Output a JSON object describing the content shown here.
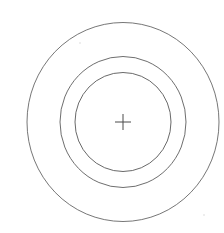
{
  "figure": {
    "kind": "concentric-circles-target",
    "background_color": "#ffffff",
    "stroke_color": "#5a5a5a",
    "canvas": {
      "width": 224,
      "height": 233
    },
    "center": {
      "x": 123,
      "y": 122
    },
    "center_mark": {
      "name": "crosshair",
      "glyph": "+",
      "half_length_x": 8,
      "half_length_y": 8,
      "stroke_color": "#4a4a4a",
      "stroke_width": 1.0
    },
    "rings": [
      {
        "id": "outer",
        "label": "outer-circle",
        "rx": 96,
        "ry": 99.5,
        "stroke_color": "#666666",
        "stroke_width": 0.9,
        "bounds": {
          "left": 27,
          "right": 219,
          "top": 22,
          "bottom": 221
        }
      },
      {
        "id": "middle",
        "label": "middle-circle",
        "rx": 63,
        "ry": 65.5,
        "stroke_color": "#5d5d5d",
        "stroke_width": 0.9,
        "bounds": {
          "left": 60,
          "right": 186,
          "top": 57,
          "bottom": 188
        }
      },
      {
        "id": "inner",
        "label": "inner-circle",
        "rx": 48,
        "ry": 49.5,
        "stroke_color": "#585858",
        "stroke_width": 0.9,
        "bounds": {
          "left": 75,
          "right": 171,
          "top": 73,
          "bottom": 172
        }
      }
    ],
    "specks": [
      {
        "x": 80,
        "y": 43,
        "r": 0.8,
        "color": "#d8d8d8"
      },
      {
        "x": 204,
        "y": 215,
        "r": 0.8,
        "color": "#dcdcdc"
      }
    ]
  }
}
